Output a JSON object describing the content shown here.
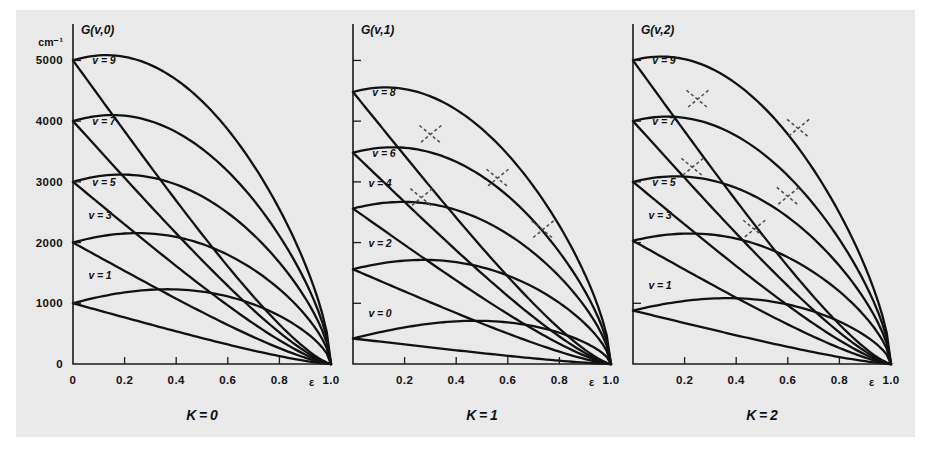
{
  "figure": {
    "background_color": "#e9e9e9",
    "curve_color": "#111111",
    "dashed_color": "#4a4a4a",
    "y_unit_label": "cm⁻¹"
  },
  "chart_data": {
    "type": "line",
    "title": "",
    "xlabel": "ε",
    "ylabel": "cm⁻¹",
    "xlim": [
      0,
      1.0
    ],
    "ylim": [
      0,
      5600
    ],
    "grid": false,
    "legend": "none",
    "x_ticks": [
      0,
      0.2,
      0.4,
      0.6,
      0.8,
      1.0
    ],
    "x_tick_labels": [
      "0",
      "0.2",
      "0.4",
      "0.6",
      "0.8",
      "1.0"
    ],
    "y_ticks": [
      0,
      1000,
      2000,
      3000,
      4000,
      5000
    ],
    "y_tick_labels": [
      "0",
      "1000",
      "2000",
      "3000",
      "4000",
      "5000"
    ],
    "panels": [
      {
        "id": "panel-K0",
        "axis_title": "G(v,0)",
        "caption": "K = 0",
        "show_y_tick_labels": true,
        "show_x_zero_label": true,
        "level_labels": [
          {
            "text": "v = 9",
            "value": 5000,
            "x": 0.075,
            "dy": 0
          },
          {
            "text": "v = 7",
            "value": 4000,
            "x": 0.075,
            "dy": 0
          },
          {
            "text": "v = 5",
            "value": 3000,
            "x": 0.075,
            "dy": 0
          },
          {
            "text": "v = 3",
            "value": 2000,
            "x": 0.06,
            "dy": -28
          },
          {
            "text": "v = 1",
            "value": 1000,
            "x": 0.06,
            "dy": -28
          }
        ],
        "origins": [
          1000,
          2000,
          3000,
          4000,
          5000
        ],
        "upper_slope": 1700,
        "lower_drop": 1,
        "avoided_crossings": []
      },
      {
        "id": "panel-K1",
        "axis_title": "G(v,1)",
        "caption": "K = 1",
        "show_y_tick_labels": false,
        "show_x_zero_label": false,
        "level_labels": [
          {
            "text": "v = 8",
            "value": 4480,
            "x": 0.075,
            "dy": 0
          },
          {
            "text": "v = 6",
            "value": 3480,
            "x": 0.075,
            "dy": 0
          },
          {
            "text": "v = 4",
            "value": 2560,
            "x": 0.06,
            "dy": -26
          },
          {
            "text": "v = 2",
            "value": 1560,
            "x": 0.06,
            "dy": -26
          },
          {
            "text": "v = 0",
            "value": 420,
            "x": 0.06,
            "dy": -26
          }
        ],
        "origins": [
          420,
          1560,
          2560,
          3480,
          4480
        ],
        "upper_slope": 1500,
        "lower_drop": 1,
        "avoided_crossings": [
          {
            "x": 0.265,
            "y": 2740
          },
          {
            "x": 0.3,
            "y": 3780
          },
          {
            "x": 0.56,
            "y": 3060
          },
          {
            "x": 0.735,
            "y": 2210
          }
        ]
      },
      {
        "id": "panel-K2",
        "axis_title": "G(v,2)",
        "caption": "K = 2",
        "show_y_tick_labels": false,
        "show_x_zero_label": false,
        "level_labels": [
          {
            "text": "v = 9",
            "value": 5000,
            "x": 0.075,
            "dy": 0
          },
          {
            "text": "v = 7",
            "value": 4000,
            "x": 0.075,
            "dy": 0
          },
          {
            "text": "v = 5",
            "value": 3000,
            "x": 0.075,
            "dy": 0
          },
          {
            "text": "v = 3",
            "value": 2030,
            "x": 0.06,
            "dy": -26
          },
          {
            "text": "v = 1",
            "value": 880,
            "x": 0.06,
            "dy": -26
          }
        ],
        "origins": [
          880,
          2030,
          3000,
          4000,
          5000
        ],
        "upper_slope": 1500,
        "lower_drop": 1,
        "avoided_crossings": [
          {
            "x": 0.25,
            "y": 4360
          },
          {
            "x": 0.23,
            "y": 3240
          },
          {
            "x": 0.64,
            "y": 3880
          },
          {
            "x": 0.6,
            "y": 2760
          },
          {
            "x": 0.47,
            "y": 2220
          }
        ]
      }
    ]
  }
}
